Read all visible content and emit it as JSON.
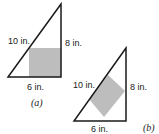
{
  "figures": [
    {
      "id": "a",
      "caption": "(a)",
      "hypotenuse_label": "10 in.",
      "height_label": "8 in.",
      "base_label": "6 in.",
      "square_orientation": "aligned with legs"
    },
    {
      "id": "b",
      "caption": "(b)",
      "hypotenuse_label": "10 in.",
      "height_label": "8 in.",
      "base_label": "6 in.",
      "square_orientation": "side on hypotenuse"
    }
  ],
  "colors": {
    "stroke": "#1a1a1a",
    "square_fill": "#bdbdbd"
  }
}
